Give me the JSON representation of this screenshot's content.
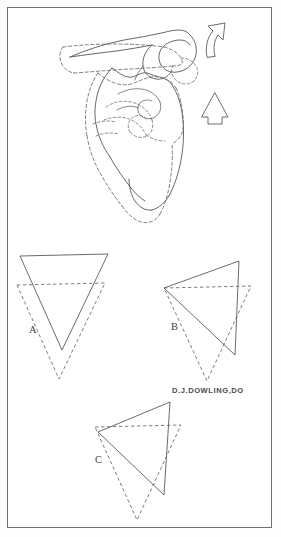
{
  "figure": {
    "background_color": "#ffffff",
    "frame_color": "#6d6f73",
    "ink_color": "#55565a",
    "width": 281,
    "height": 537
  },
  "anatomy_panel": {
    "name": "scapula-illustration",
    "description": "Line drawing of a scapula shown in two positions: solid outline for one position and dashed outline for the displaced position",
    "solid_outline_label": "scapula-solid-position",
    "dashed_outline_label": "scapula-dashed-position"
  },
  "arrows": [
    {
      "id": "curved-arrow",
      "name": "curved-rotation-arrow",
      "direction": "counterclockwise-up-left",
      "x": 218,
      "y": 40
    },
    {
      "id": "straight-arrow",
      "name": "straight-up-arrow",
      "direction": "up",
      "x": 215,
      "y": 112
    }
  ],
  "triangles": [
    {
      "id": "A",
      "label": "A",
      "label_x": 29,
      "label_y": 333,
      "solid_name": "triangle-a-solid",
      "dashed_name": "triangle-a-dashed",
      "motion": "inferior translation"
    },
    {
      "id": "B",
      "label": "B",
      "label_x": 171,
      "label_y": 330,
      "solid_name": "triangle-b-solid",
      "dashed_name": "triangle-b-dashed",
      "motion": "rotation"
    },
    {
      "id": "C",
      "label": "C",
      "label_x": 95,
      "label_y": 463,
      "solid_name": "triangle-c-solid",
      "dashed_name": "triangle-c-dashed",
      "motion": "rotation and translation"
    }
  ],
  "signature": {
    "text": "D.J.DOWLING,DO",
    "x": 172,
    "y": 393
  }
}
